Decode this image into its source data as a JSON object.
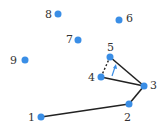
{
  "diagram": {
    "point_color": "#3a8ee6",
    "edge_color": "#222222",
    "points": [
      {
        "id": "1",
        "x": 41,
        "y": 117,
        "lx": 28,
        "ly": 112
      },
      {
        "id": "2",
        "x": 129,
        "y": 104,
        "lx": 124,
        "ly": 112
      },
      {
        "id": "3",
        "x": 144,
        "y": 86,
        "lx": 150,
        "ly": 80
      },
      {
        "id": "4",
        "x": 101,
        "y": 77,
        "lx": 88,
        "ly": 72
      },
      {
        "id": "5",
        "x": 110,
        "y": 57,
        "lx": 107,
        "ly": 42
      },
      {
        "id": "6",
        "x": 119,
        "y": 20,
        "lx": 126,
        "ly": 13
      },
      {
        "id": "7",
        "x": 78,
        "y": 40,
        "lx": 66,
        "ly": 34
      },
      {
        "id": "8",
        "x": 58,
        "y": 14,
        "lx": 45,
        "ly": 9
      },
      {
        "id": "9",
        "x": 25,
        "y": 60,
        "lx": 10,
        "ly": 55
      }
    ],
    "edges": [
      [
        "1",
        "2"
      ],
      [
        "2",
        "3"
      ],
      [
        "3",
        "5"
      ],
      [
        "3",
        "4"
      ]
    ],
    "dashed_edges": [
      [
        "4",
        "5"
      ]
    ],
    "arrow": {
      "from": [
        112,
        76
      ],
      "to": [
        115,
        66
      ]
    }
  }
}
